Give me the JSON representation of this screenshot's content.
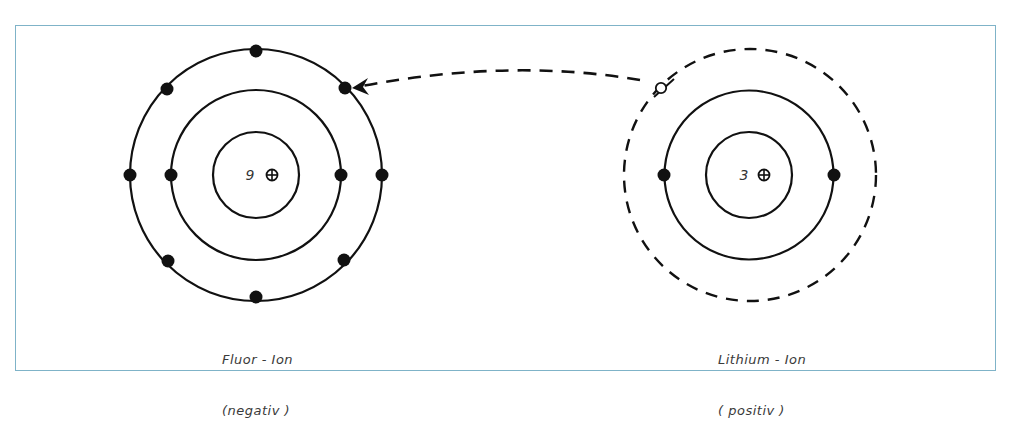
{
  "diagram": {
    "type": "ionic-bond-electron-transfer",
    "frame_color": "#7fb3c8",
    "line_color": "#111111",
    "atoms": [
      {
        "id": "fluorine",
        "label_line1": "Fluor - Ion",
        "label_line2": "(negativ )",
        "nucleus_charge": "9",
        "nucleus_symbol": "⊕",
        "shells": [
          {
            "electrons": 2,
            "style": "solid"
          },
          {
            "electrons": 8,
            "style": "solid"
          }
        ]
      },
      {
        "id": "lithium",
        "label_line1": "Lithium - Ion",
        "label_line2": "( positiv )",
        "nucleus_charge": "3",
        "nucleus_symbol": "⊕",
        "shells": [
          {
            "electrons": 2,
            "style": "solid"
          },
          {
            "electrons": 0,
            "style": "dashed",
            "note": "vacated electron position (hollow circle)"
          }
        ]
      }
    ],
    "transfer_arrow": {
      "from": "lithium outer shell",
      "to": "fluorine outer shell",
      "style": "dashed"
    }
  }
}
